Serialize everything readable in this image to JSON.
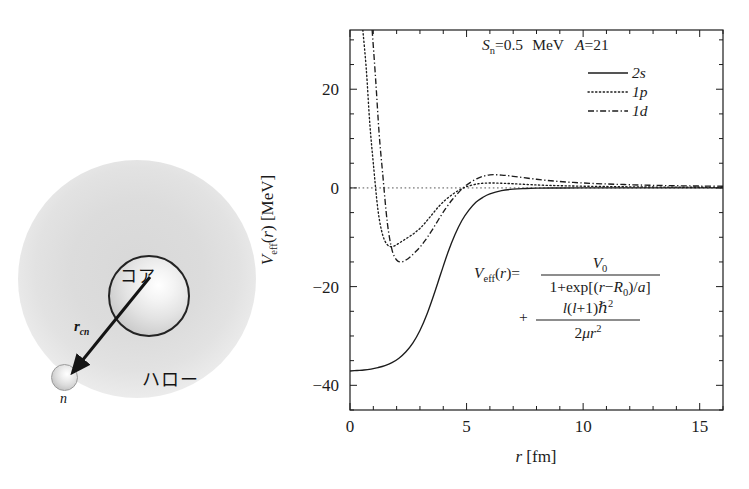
{
  "illustration": {
    "core_label": "コア",
    "halo_label": "ハロー",
    "vector_label": "r",
    "vector_sub": "cn",
    "neutron_label": "n",
    "cloud_name": "halo-cloud",
    "core_name": "core-sphere",
    "neutron_name": "neutron-sphere"
  },
  "chart_data": {
    "type": "line",
    "title": "",
    "xlabel": "r [fm]",
    "ylabel": "V_eff(r) [MeV]",
    "xlim": [
      0,
      16
    ],
    "ylim": [
      -45,
      32
    ],
    "xticks": [
      0,
      5,
      10,
      15
    ],
    "xtick_labels": [
      "0",
      "5",
      "10",
      "15"
    ],
    "yticks": [
      20,
      0,
      -20,
      -40
    ],
    "ytick_labels": [
      "20",
      "0",
      "−20",
      "−40"
    ],
    "minor_x_step": 1,
    "minor_y_step": 5,
    "grid": false,
    "zero_line": true,
    "legend_position": "top-right",
    "annotations": {
      "params_Sn_sym": "S",
      "params_Sn_sub": "n",
      "params_Sn_val": "=0.5",
      "params_unit": "MeV",
      "params_A_sym": "A",
      "params_A_val": "=21",
      "params_text": "S_n=0.5 MeV  A=21",
      "equation_text": "V_eff(r) = V_0 / (1+exp[(r−R_0)/a]) + l(l+1)ħ²/(2μr²)",
      "eq_lhs": "V",
      "eq_lhs_sub": "eff",
      "eq_lhs_arg": "(r)=",
      "eq_num1": "V",
      "eq_num1_sub": "0",
      "eq_den1": "1+exp[(r−R",
      "eq_den1_sub": "0",
      "eq_den1_end": ")/a]",
      "eq_plus": "+",
      "eq_num2": "l(l+1)ħ",
      "eq_num2_sup": "2",
      "eq_den2": "2μr",
      "eq_den2_sup": "2"
    },
    "series": [
      {
        "name": "2s",
        "label": "2s",
        "style": "solid",
        "l": 0,
        "x": [
          0.0,
          0.3,
          0.6,
          0.9,
          1.2,
          1.5,
          1.8,
          2.1,
          2.4,
          2.7,
          3.0,
          3.3,
          3.6,
          3.9,
          4.2,
          4.5,
          4.8,
          5.1,
          5.4,
          5.7,
          6.0,
          6.5,
          7.0,
          7.5,
          8.0,
          9.0,
          10.0,
          11.0,
          12.0,
          13.0,
          14.0,
          15.0,
          16.0
        ],
        "y": [
          -37.1,
          -37.0,
          -36.9,
          -36.7,
          -36.4,
          -36.0,
          -35.4,
          -34.5,
          -33.2,
          -31.4,
          -28.9,
          -25.6,
          -21.6,
          -17.3,
          -13.1,
          -9.5,
          -6.6,
          -4.5,
          -2.9,
          -1.9,
          -1.2,
          -0.55,
          -0.25,
          -0.12,
          -0.05,
          -0.01,
          0.0,
          0.0,
          0.0,
          0.0,
          0.0,
          0.0,
          0.0
        ]
      },
      {
        "name": "1p",
        "label": "1p",
        "style": "dotted",
        "l": 1,
        "x": [
          0.55,
          0.7,
          0.85,
          1.0,
          1.2,
          1.4,
          1.6,
          1.8,
          2.0,
          2.2,
          2.4,
          2.6,
          2.8,
          3.0,
          3.2,
          3.5,
          3.8,
          4.1,
          4.4,
          4.7,
          5.0,
          5.5,
          6.0,
          6.5,
          7.0,
          8.0,
          9.0,
          10.0,
          11.0,
          12.0,
          13.0,
          14.0,
          15.0,
          16.0
        ],
        "y": [
          32.0,
          24.0,
          13.0,
          5.0,
          -4.5,
          -9.5,
          -11.5,
          -11.9,
          -11.5,
          -10.9,
          -10.3,
          -9.7,
          -9.0,
          -8.2,
          -7.2,
          -5.5,
          -3.8,
          -2.4,
          -1.3,
          -0.4,
          0.25,
          0.85,
          1.0,
          0.95,
          0.85,
          0.6,
          0.45,
          0.35,
          0.28,
          0.22,
          0.18,
          0.15,
          0.13,
          0.12
        ]
      },
      {
        "name": "1d",
        "style": "dashdot",
        "label": "1d",
        "l": 2,
        "x": [
          0.95,
          1.1,
          1.25,
          1.4,
          1.6,
          1.8,
          2.0,
          2.2,
          2.4,
          2.6,
          2.8,
          3.0,
          3.2,
          3.5,
          3.8,
          4.1,
          4.4,
          4.7,
          5.0,
          5.5,
          6.0,
          6.5,
          7.0,
          8.0,
          9.0,
          10.0,
          11.0,
          12.0,
          13.0,
          14.0,
          15.0,
          16.0
        ],
        "y": [
          32.0,
          22.0,
          11.0,
          3.0,
          -7.0,
          -12.5,
          -14.6,
          -15.0,
          -14.6,
          -13.9,
          -13.0,
          -12.0,
          -10.8,
          -8.7,
          -6.4,
          -4.2,
          -2.3,
          -0.7,
          0.6,
          2.0,
          2.65,
          2.6,
          2.35,
          1.75,
          1.3,
          1.0,
          0.8,
          0.65,
          0.52,
          0.44,
          0.38,
          0.34
        ]
      }
    ]
  }
}
